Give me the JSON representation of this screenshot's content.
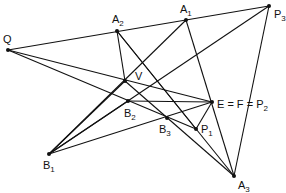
{
  "diagram": {
    "type": "projective-geometry-construction",
    "points": [
      {
        "id": "Q",
        "label": "Q",
        "sub": ""
      },
      {
        "id": "A2",
        "label": "A",
        "sub": "2"
      },
      {
        "id": "A1",
        "label": "A",
        "sub": "1"
      },
      {
        "id": "P3",
        "label": "P",
        "sub": "3"
      },
      {
        "id": "V",
        "label": "V",
        "sub": ""
      },
      {
        "id": "B2",
        "label": "B",
        "sub": "2"
      },
      {
        "id": "B3",
        "label": "B",
        "sub": "3"
      },
      {
        "id": "E",
        "label": "E = F = P",
        "sub": "2"
      },
      {
        "id": "P1",
        "label": "P",
        "sub": "1"
      },
      {
        "id": "B1",
        "label": "B",
        "sub": "1"
      },
      {
        "id": "A3",
        "label": "A",
        "sub": "3"
      }
    ],
    "segments": [
      [
        "Q",
        "P3"
      ],
      [
        "Q",
        "E"
      ],
      [
        "Q",
        "P1"
      ],
      [
        "A2",
        "V"
      ],
      [
        "A2",
        "A3"
      ],
      [
        "A2",
        "P1"
      ],
      [
        "A1",
        "B1"
      ],
      [
        "A1",
        "A3"
      ],
      [
        "P3",
        "B1"
      ],
      [
        "P3",
        "A3"
      ],
      [
        "B1",
        "V"
      ],
      [
        "B1",
        "E"
      ],
      [
        "B1",
        "B2"
      ],
      [
        "V",
        "A3"
      ],
      [
        "B2",
        "E"
      ],
      [
        "E",
        "P1"
      ]
    ]
  }
}
